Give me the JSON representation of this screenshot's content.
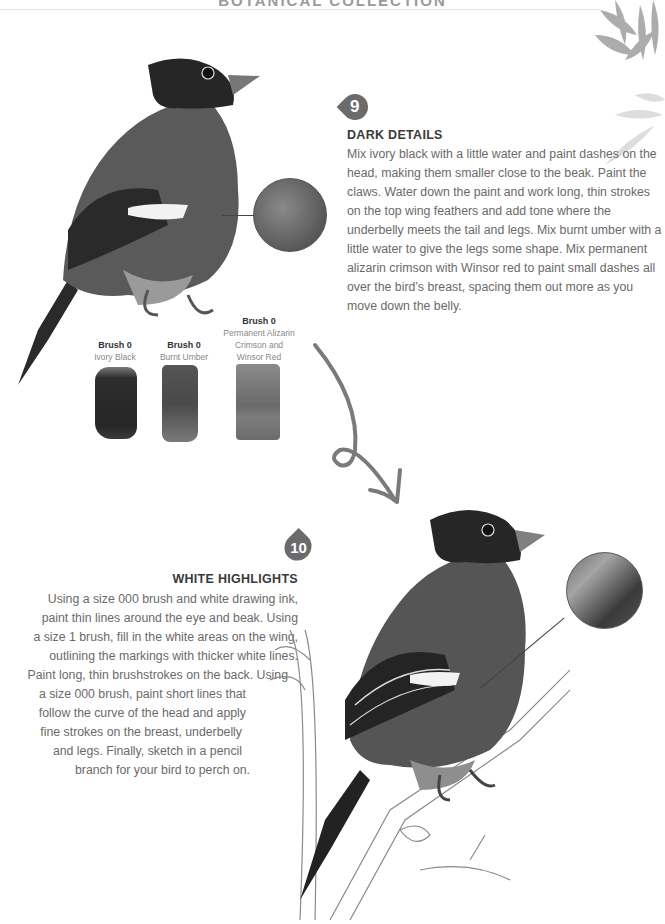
{
  "header": {
    "title": "BOTANICAL COLLECTION"
  },
  "step9": {
    "number": "9",
    "heading": "DARK DETAILS",
    "body": "Mix ivory black with a little water and paint dashes on the head, making them smaller close to the beak. Paint the claws. Water down the paint and work long, thin strokes on the top wing feathers and add tone where the underbelly meets the tail and legs. Mix burnt umber with a little water to give the legs some shape. Mix permanent alizarin crimson with Winsor red to paint small dashes all over the bird’s breast, spacing them out more as you move down the belly."
  },
  "brushes": [
    {
      "brush": "Brush 0",
      "color": "Ivory Black"
    },
    {
      "brush": "Brush 0",
      "color": "Burnt Umber"
    },
    {
      "brush": "Brush 0",
      "color": "Permanent Alizarin Crimson and Winsor Red"
    }
  ],
  "step10": {
    "number": "10",
    "heading": "WHITE HIGHLIGHTS",
    "lines": [
      "Using a size 000 brush and white drawing ink,",
      "paint thin lines around the eye and beak. Using",
      "a size 1 brush, fill in the white areas on the wing,",
      "outlining the markings with thicker white lines.",
      "Paint long, thin brushstrokes on the back. Using",
      "a size 000 brush, paint short lines that",
      "follow the curve of the head and apply",
      "fine strokes on the breast, underbelly",
      "and legs. Finally, sketch in a pencil",
      "branch for your bird to perch on."
    ]
  },
  "illustrations": {
    "top_bird": "bullfinch-painting-step-9",
    "bottom_bird": "bullfinch-painting-step-10-on-branch",
    "detail_circle_1": "breast-texture-detail",
    "detail_circle_2": "back-feather-highlight-detail"
  },
  "colors": {
    "badge": "#6b6b6b",
    "heading": "#3a3a3a",
    "body_text": "#6a6a6a",
    "arrow": "#7a7a7a"
  }
}
